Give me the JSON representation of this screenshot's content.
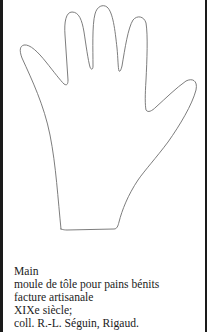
{
  "figure": {
    "stroke_color": "#6e6e6e",
    "background_color": "#ffffff",
    "border_color": "#1a1a1a"
  },
  "caption": {
    "title": "Main",
    "description": "moule de tôle pour pains bénits",
    "craft": "facture artisanale",
    "period": "XIXe siècle;",
    "collection": "coll. R.-L. Séguin, Rigaud."
  }
}
